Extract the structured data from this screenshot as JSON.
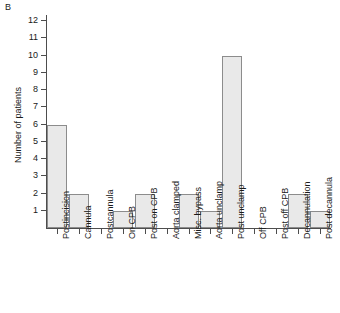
{
  "panel": {
    "label": "B"
  },
  "chart_data": {
    "type": "bar",
    "title": "",
    "xlabel": "",
    "ylabel": "Number of patients",
    "ylim": [
      0,
      12
    ],
    "yticks": [
      1,
      2,
      3,
      4,
      5,
      6,
      7,
      8,
      9,
      10,
      11,
      12
    ],
    "grid": false,
    "legend": null,
    "bar_color": "#e9e9e9",
    "bar_edge_color": "#8c8c8c",
    "axis_color": "#4d4d4d",
    "categories": [
      "Postincision",
      "Cannula",
      "Postcannula",
      "On CPB",
      "Post on CPB",
      "Aorta clamped",
      "Misc. bypass",
      "Aorta unclamp",
      "Post unclamp",
      "Off CPB",
      "Post off CPB",
      "Decannulation",
      "Post decannula"
    ],
    "values": [
      6,
      2,
      0,
      1,
      2,
      0,
      2,
      1,
      10,
      0,
      0,
      2,
      1
    ]
  }
}
